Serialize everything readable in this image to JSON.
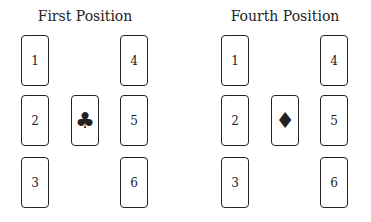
{
  "panels": [
    {
      "title": "First Position",
      "cards": [
        "1",
        "2",
        "3",
        "4",
        "5",
        "6"
      ],
      "center_suit": "♣",
      "center_suit_name": "club"
    },
    {
      "title": "Fourth Position",
      "cards": [
        "1",
        "2",
        "3",
        "4",
        "5",
        "6"
      ],
      "center_suit": "♦",
      "center_suit_name": "diamond"
    }
  ]
}
